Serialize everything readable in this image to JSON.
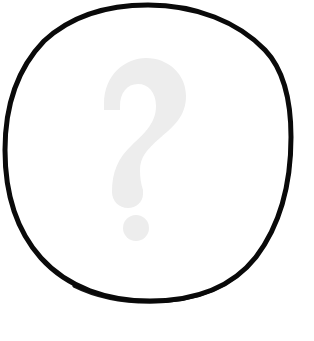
{
  "image": {
    "kind": "placeholder-graphic",
    "semantic_label": "unknown-placeholder",
    "alt_text": "Question mark inside a circle",
    "background_color": "#ffffff",
    "width": 314,
    "height": 341
  },
  "circle": {
    "name": "circle-outline",
    "stroke_color": "#0a0a0a",
    "fill_color": "#ffffff",
    "stroke_width": 5,
    "center_x": 148,
    "center_y": 152,
    "radius_x": 142,
    "radius_y": 147,
    "style": "hand-drawn-irregular"
  },
  "question_mark": {
    "name": "question-mark-glyph",
    "character": "?",
    "color": "#ededed",
    "center_x": 140,
    "top_y": 58,
    "bottom_y": 240,
    "left_x": 100,
    "right_x": 185,
    "dot_center_x": 136,
    "dot_center_y": 228,
    "dot_radius": 13
  }
}
